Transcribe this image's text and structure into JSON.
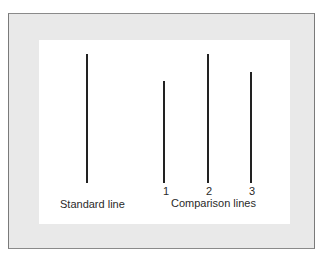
{
  "diagram": {
    "title": "",
    "standard": {
      "label": "Standard line",
      "line": {
        "x": 87,
        "top": 54,
        "bottom": 183
      }
    },
    "comparison": {
      "label": "Comparison lines",
      "lines": [
        {
          "number": "1",
          "x": 164,
          "top": 81,
          "bottom": 183
        },
        {
          "number": "2",
          "x": 208,
          "top": 54,
          "bottom": 183
        },
        {
          "number": "3",
          "x": 251,
          "top": 72,
          "bottom": 183
        }
      ]
    },
    "colors": {
      "frame_background": "#e9e9e9",
      "panel_background": "#ffffff",
      "line_color": "#222222",
      "text_color": "#2a2a2a"
    }
  }
}
